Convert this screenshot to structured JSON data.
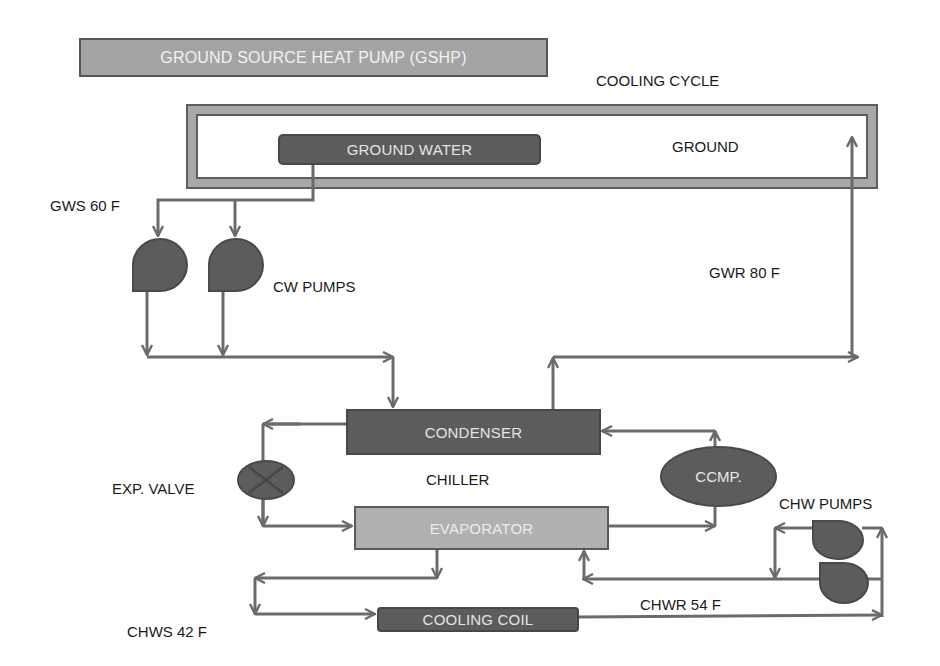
{
  "title": "GROUND SOURCE  HEAT PUMP (GSHP)",
  "subtitle": "COOLING CYCLE",
  "ground": {
    "label": "GROUND",
    "ground_water_label": "GROUND WATER"
  },
  "labels": {
    "gws": "GWS 60 F",
    "gwr": "GWR 80 F",
    "cw_pumps": "CW PUMPS",
    "exp_valve": "EXP. VALVE",
    "chiller": "CHILLER",
    "chw_pumps": "CHW PUMPS",
    "chws": "CHWS 42 F",
    "chwr": "CHWR 54 F"
  },
  "components": {
    "condenser": "CONDENSER",
    "evaporator": "EVAPORATOR",
    "compressor": "CCMP.",
    "cooling_coil": "COOLING COIL"
  },
  "colors": {
    "pipe": "#6b6b6b",
    "dark_component": "#5c5c5c",
    "light_component": "#b0b0b0",
    "ground_border": "#a8a8a8",
    "text": "#1a1a1a"
  }
}
